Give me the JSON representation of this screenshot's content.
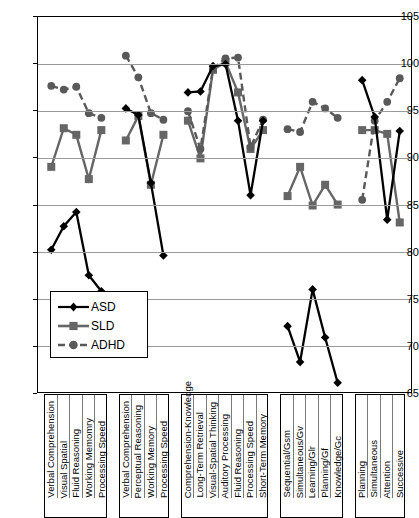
{
  "chart_data": {
    "type": "line",
    "title": "",
    "xlabel": "",
    "ylabel": "",
    "ylim": [
      65,
      105
    ],
    "yticks": [
      65,
      70,
      75,
      80,
      85,
      90,
      95,
      100,
      105
    ],
    "grid": true,
    "legend_position": "inside-lower-left",
    "legend": [
      "ASD",
      "SLD",
      "ADHD"
    ],
    "series_styles": [
      {
        "name": "ASD",
        "color": "#000000",
        "marker": "diamond",
        "line": "solid"
      },
      {
        "name": "SLD",
        "color": "#666666",
        "marker": "square",
        "line": "solid"
      },
      {
        "name": "ADHD",
        "color": "#595959",
        "marker": "circle",
        "line": "dashed"
      }
    ],
    "groups": [
      {
        "name": "WISC-V",
        "categories": [
          "Verbal Comprehension",
          "Visual Spatial",
          "Fluid Reasoning",
          "Working Memomry",
          "Processing Speed"
        ],
        "series": [
          {
            "name": "ASD",
            "values": [
              80.3,
              82.8,
              84.3,
              77.6,
              75.9
            ]
          },
          {
            "name": "SLD",
            "values": [
              89.1,
              93.2,
              92.5,
              87.8,
              93.0
            ]
          },
          {
            "name": "ADHD",
            "values": [
              97.7,
              97.3,
              97.6,
              94.8,
              94.3
            ]
          }
        ]
      },
      {
        "name": "WISC-IV",
        "categories": [
          "Verbal Comprehension",
          "Perceptual Reasoning",
          "Working Memory",
          "Processing Speed"
        ],
        "series": [
          {
            "name": "ASD",
            "values": [
              95.3,
              94.6,
              87.4,
              79.7
            ]
          },
          {
            "name": "SLD",
            "values": [
              91.9,
              94.5,
              87.2,
              92.5
            ]
          },
          {
            "name": "ADHD",
            "values": [
              100.9,
              98.6,
              94.8,
              94.1
            ]
          }
        ]
      },
      {
        "name": "WJ",
        "categories": [
          "Comprehension-Knowledge",
          "Long-Term Retrieval",
          "Visual-Spatial Thinking",
          "Auditory Processing",
          "Fluid Reasoning",
          "Processing Speed",
          "Short-Term Memory"
        ],
        "series": [
          {
            "name": "ASD",
            "values": [
              97.0,
              97.1,
              99.8,
              100.0,
              94.0,
              86.1,
              94.0
            ]
          },
          {
            "name": "SLD",
            "values": [
              94.0,
              90.0,
              99.4,
              100.2,
              97.0,
              91.0,
              93.0
            ]
          },
          {
            "name": "ADHD",
            "values": [
              95.0,
              91.0,
              99.5,
              100.6,
              100.7,
              91.2,
              94.1
            ]
          }
        ]
      },
      {
        "name": "KABC-II",
        "categories": [
          "Sequential/Gsm",
          "Simultaneous/Gv",
          "Learning/Glr",
          "Planning/Gf",
          "Knowledge/Gc"
        ],
        "series": [
          {
            "name": "ASD",
            "values": [
              72.2,
              68.4,
              76.1,
              71.0,
              66.2
            ]
          },
          {
            "name": "SLD",
            "values": [
              86.0,
              89.1,
              85.0,
              87.2,
              85.1
            ]
          },
          {
            "name": "ADHD",
            "values": [
              93.1,
              92.8,
              96.0,
              95.3,
              94.3
            ]
          }
        ]
      },
      {
        "name": "CAS",
        "categories": [
          "Planning",
          "Simultaneous",
          "Attention",
          "Successive"
        ],
        "series": [
          {
            "name": "ASD",
            "values": [
              98.3,
              94.4,
              83.5,
              92.9
            ]
          },
          {
            "name": "SLD",
            "values": [
              93.0,
              93.0,
              92.6,
              83.2
            ]
          },
          {
            "name": "ADHD",
            "values": [
              85.6,
              94.0,
              96.0,
              98.5
            ]
          }
        ]
      }
    ]
  }
}
